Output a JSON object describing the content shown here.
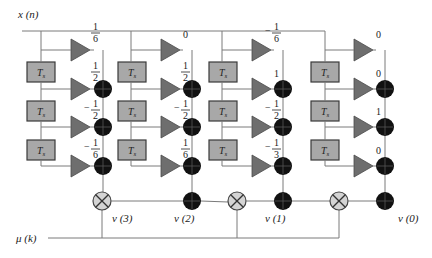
{
  "labels": {
    "input": "x (n)",
    "mu": "μ (k)",
    "ts": "T",
    "ts_sub": "s"
  },
  "outputs": [
    "v (3)",
    "v (2)",
    "v (1)",
    "v (0)"
  ],
  "columns": [
    {
      "name": "col-1",
      "top_coef": {
        "sign": "",
        "num": "1",
        "den": "6"
      },
      "coefs": [
        {
          "sign": "",
          "num": "1",
          "den": "2"
        },
        {
          "sign": "−",
          "num": "1",
          "den": "2"
        },
        {
          "sign": "−",
          "num": "1",
          "den": "6"
        }
      ]
    },
    {
      "name": "col-2",
      "top_coef": {
        "sign": "",
        "int": "0"
      },
      "coefs": [
        {
          "sign": "",
          "num": "1",
          "den": "2"
        },
        {
          "sign": "−",
          "num": "1",
          "den": "2"
        },
        {
          "sign": "",
          "num": "1",
          "den": "6"
        }
      ]
    },
    {
      "name": "col-3",
      "top_coef": {
        "sign": "−",
        "num": "1",
        "den": "6"
      },
      "coefs": [
        {
          "sign": "",
          "int": "1"
        },
        {
          "sign": "−",
          "num": "1",
          "den": "2"
        },
        {
          "sign": "−",
          "num": "1",
          "den": "3"
        }
      ]
    },
    {
      "name": "col-4",
      "top_coef": {
        "sign": "",
        "int": "0"
      },
      "coefs": [
        {
          "sign": "",
          "int": "0"
        },
        {
          "sign": "",
          "int": "1"
        },
        {
          "sign": "",
          "int": "0"
        }
      ]
    }
  ],
  "colors": {
    "wire": "#7a7a7a",
    "delay_box": "#a8a8a8",
    "gain_triangle": "#6e6e6e",
    "adder": "#111111",
    "multiplier": "#d4d4d4"
  }
}
